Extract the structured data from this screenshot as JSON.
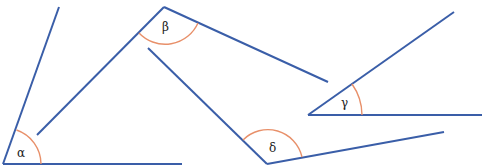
{
  "diagram": {
    "title": "",
    "colors": {
      "ray": "#3a5ea8",
      "arc": "#e8906a",
      "label": "#222222"
    },
    "angles": [
      {
        "id": "alpha",
        "label": "α",
        "vertex": [
          3,
          164
        ],
        "ray1_end": [
          59,
          7
        ],
        "ray2_end": [
          182,
          164
        ],
        "arc_path": "M 16.5 130 A 40 40 0 0 1 43 164",
        "label_pos": [
          17,
          157
        ]
      },
      {
        "id": "beta",
        "label": "β",
        "vertex": [
          164,
          7
        ],
        "ray1_end": [
          37,
          135
        ],
        "ray2_end": [
          328,
          82
        ],
        "arc_path": "M 139 33 A 36 36 0 0 0 198 23",
        "label_pos": [
          162,
          31
        ]
      },
      {
        "id": "gamma",
        "label": "γ",
        "vertex": [
          308,
          115
        ],
        "ray1_end": [
          454,
          12
        ],
        "ray2_end": [
          482,
          115
        ],
        "arc_path": "M 352 84 A 54 54 0 0 1 362 115",
        "label_pos": [
          341,
          107
        ]
      },
      {
        "id": "delta",
        "label": "δ",
        "vertex": [
          267,
          164
        ],
        "ray1_end": [
          148,
          48
        ],
        "ray2_end": [
          444,
          132
        ],
        "arc_path": "M 243 140 A 35 35 0 0 1 302 157",
        "label_pos": [
          269,
          152
        ]
      }
    ]
  }
}
